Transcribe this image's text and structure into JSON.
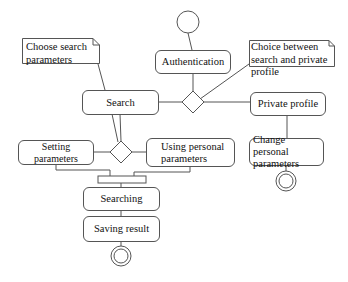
{
  "diagram": {
    "type": "uml-activity",
    "colors": {
      "stroke": "#555555",
      "background": "#ffffff",
      "text": "#111111"
    },
    "start": {
      "label": ""
    },
    "activities": {
      "authentication": "Authentication",
      "search": "Search",
      "private_profile": "Private profile",
      "setting_parameters": "Setting parameters",
      "using_personal_parameters": "Using personal parameters",
      "change_personal_parameters": "Change personal parameters",
      "searching": "Searching",
      "saving_result": "Saving result"
    },
    "notes": {
      "choose_search_parameters": "Choose search parameters",
      "choice_between": "Choice between search and private profile"
    },
    "flows": [
      [
        "start",
        "authentication"
      ],
      [
        "authentication",
        "decision-1"
      ],
      [
        "decision-1",
        "search"
      ],
      [
        "decision-1",
        "private_profile"
      ],
      [
        "private_profile",
        "change_personal_parameters"
      ],
      [
        "change_personal_parameters",
        "end-right"
      ],
      [
        "search",
        "decision-2"
      ],
      [
        "decision-2",
        "setting_parameters"
      ],
      [
        "decision-2",
        "using_personal_parameters"
      ],
      [
        "setting_parameters",
        "join-bar"
      ],
      [
        "using_personal_parameters",
        "join-bar"
      ],
      [
        "join-bar",
        "searching"
      ],
      [
        "searching",
        "saving_result"
      ],
      [
        "saving_result",
        "end-bottom"
      ]
    ]
  }
}
